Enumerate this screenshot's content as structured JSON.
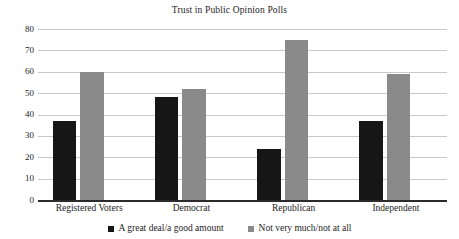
{
  "chart_data": {
    "type": "bar",
    "title": "Trust in Public Opinion Polls",
    "xlabel": "",
    "ylabel": "",
    "ylim": [
      0,
      80
    ],
    "ytick_step": 10,
    "yticks": [
      80,
      70,
      60,
      50,
      40,
      30,
      20,
      10,
      0
    ],
    "grid": true,
    "legend_position": "bottom",
    "categories": [
      "Registered Voters",
      "Democrat",
      "Republican",
      "Independent"
    ],
    "series": [
      {
        "name": "A great deal/a good amount",
        "color": "#161616",
        "values": [
          37,
          48,
          24,
          37
        ]
      },
      {
        "name": "Not very much/not at all",
        "color": "#8a8a8a",
        "values": [
          60,
          52,
          75,
          59
        ]
      }
    ]
  }
}
